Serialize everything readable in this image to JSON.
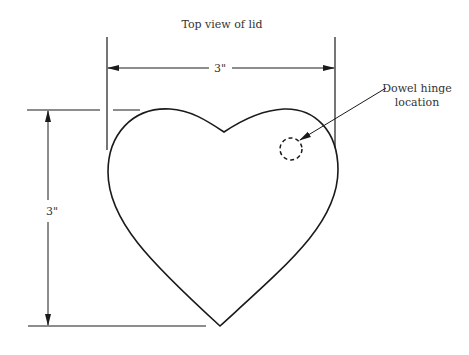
{
  "title": "Top view of lid",
  "dimensions": {
    "width_label": "3\"",
    "height_label": "3\""
  },
  "callout": {
    "line1": "Dowel hinge",
    "line2": "location"
  },
  "colors": {
    "stroke": "#1a1a1a",
    "text": "#333333",
    "background": "#ffffff"
  }
}
